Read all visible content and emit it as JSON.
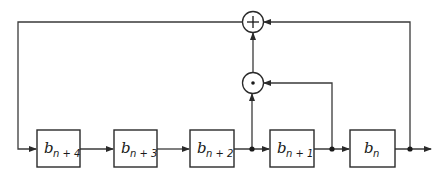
{
  "diagram": {
    "type": "shift-register feedback block diagram",
    "colors": {
      "line": "#3a3a3a",
      "background": "#ffffff"
    },
    "registers": [
      {
        "id": "b_n+4",
        "base": "b",
        "subscript": "n + 4"
      },
      {
        "id": "b_n+3",
        "base": "b",
        "subscript": "n + 3"
      },
      {
        "id": "b_n+2",
        "base": "b",
        "subscript": "n + 2"
      },
      {
        "id": "b_n+1",
        "base": "b",
        "subscript": "n + 1"
      },
      {
        "id": "b_n",
        "base": "b",
        "subscript": "n"
      }
    ],
    "operators": [
      {
        "id": "adder",
        "symbol": "+",
        "meaning": "modulo-2 addition"
      },
      {
        "id": "multiplier",
        "symbol": "·",
        "meaning": "multiplication (AND)"
      }
    ],
    "connections": [
      "b_n+4 -> b_n+3",
      "b_n+3 -> b_n+2",
      "b_n+2 -> b_n+1",
      "b_n+2 tap -> multiplier (bottom)",
      "b_n+1 -> b_n",
      "b_n+1 tap -> multiplier (right)",
      "multiplier -> adder (bottom)",
      "b_n tap -> adder (right)",
      "adder -> feedback -> b_n+4",
      "b_n -> output"
    ]
  }
}
